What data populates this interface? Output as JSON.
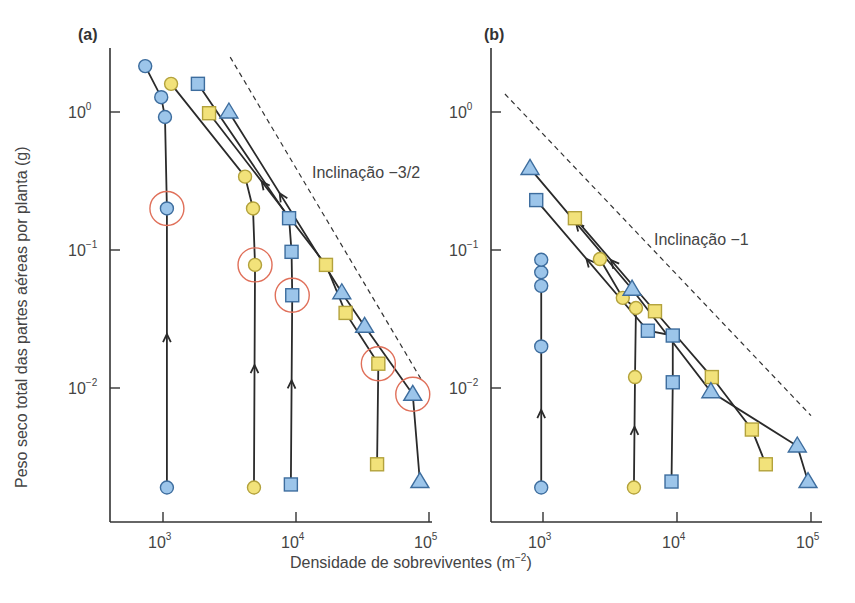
{
  "figure": {
    "ylabel": "Peso seco total das partes aéreas por planta (g)",
    "xlabel": "Densidade de sobreviventes (m",
    "xlabel_sup": "−2",
    "xlabel_close": ")",
    "colors": {
      "blue_fill": "#9cc5ea",
      "blue_stroke": "#3d6d9e",
      "yellow_fill": "#f2e27a",
      "yellow_stroke": "#b3a23c",
      "highlight_ring": "#e0705a",
      "line": "#2a2a2a"
    }
  },
  "chart_data": [
    {
      "panel": "(a)",
      "type": "scatter",
      "title": "(a)",
      "xlabel": "Densidade de sobreviventes (m^-2)",
      "ylabel": "Peso seco total das partes aéreas por planta (g)",
      "xscale": "log",
      "yscale": "log",
      "xlim": [
        400,
        110000
      ],
      "ylim": [
        0.0012,
        3.3
      ],
      "xticks": [
        "10^3",
        "10^4",
        "10^5"
      ],
      "yticks": [
        "10^0",
        "10^-1",
        "10^-2"
      ],
      "grid": false,
      "annotation": "Inclinação −3/2",
      "reference_line": {
        "style": "dashed",
        "slope": -1.5,
        "from": [
          3200,
          2.5
        ],
        "to": [
          90000,
          0.011
        ]
      },
      "series": [
        {
          "name": "blue circles",
          "marker": "circle",
          "color": "blue",
          "points": [
            [
              1070,
              0.0019
            ],
            [
              1070,
              0.2
            ],
            [
              1035,
              0.92
            ],
            [
              970,
              1.28
            ],
            [
              735,
              2.15
            ]
          ],
          "highlighted": [
            [
              1070,
              0.2
            ]
          ]
        },
        {
          "name": "yellow circles",
          "marker": "circle",
          "color": "yellow",
          "points": [
            [
              4830,
              0.0019
            ],
            [
              4920,
              0.078
            ],
            [
              4750,
              0.2
            ],
            [
              4140,
              0.34
            ],
            [
              1150,
              1.6
            ]
          ],
          "highlighted": [
            [
              4920,
              0.078
            ]
          ]
        },
        {
          "name": "blue squares",
          "marker": "square",
          "color": "blue",
          "points": [
            [
              9150,
              0.002
            ],
            [
              9370,
              0.047
            ],
            [
              9260,
              0.097
            ],
            [
              8870,
              0.17
            ],
            [
              1830,
              1.6
            ]
          ],
          "highlighted": [
            [
              9370,
              0.047
            ]
          ]
        },
        {
          "name": "yellow squares",
          "marker": "square",
          "color": "yellow",
          "points": [
            [
              40700,
              0.0028
            ],
            [
              41600,
              0.015
            ],
            [
              23600,
              0.035
            ],
            [
              16800,
              0.078
            ],
            [
              2220,
              0.98
            ]
          ],
          "highlighted": [
            [
              41600,
              0.015
            ]
          ]
        },
        {
          "name": "blue triangles",
          "marker": "triangle",
          "color": "blue",
          "points": [
            [
              85400,
              0.0021
            ],
            [
              75500,
              0.009
            ],
            [
              32800,
              0.028
            ],
            [
              22100,
              0.049
            ],
            [
              3130,
              1.0
            ]
          ],
          "highlighted": [
            [
              75500,
              0.009
            ]
          ]
        }
      ]
    },
    {
      "panel": "(b)",
      "type": "scatter",
      "title": "(b)",
      "xlabel": "Densidade de sobreviventes (m^-2)",
      "ylabel": "Peso seco total das partes aéreas por planta (g)",
      "xscale": "log",
      "yscale": "log",
      "xlim": [
        400,
        110000
      ],
      "ylim": [
        0.0012,
        3.3
      ],
      "xticks": [
        "10^3",
        "10^4",
        "10^5"
      ],
      "yticks": [
        "10^0",
        "10^-1",
        "10^-2"
      ],
      "grid": false,
      "annotation": "Inclinação −1",
      "reference_line": {
        "style": "dashed",
        "slope": -1,
        "from": [
          520,
          1.35
        ],
        "to": [
          100000,
          0.0063
        ]
      },
      "series": [
        {
          "name": "blue circles",
          "marker": "circle",
          "color": "blue",
          "points": [
            [
              970,
              0.0019
            ],
            [
              970,
              0.02
            ],
            [
              970,
              0.055
            ],
            [
              970,
              0.069
            ],
            [
              970,
              0.085
            ]
          ]
        },
        {
          "name": "yellow circles",
          "marker": "circle",
          "color": "yellow",
          "points": [
            [
              4770,
              0.0019
            ],
            [
              4860,
              0.012
            ],
            [
              4940,
              0.038
            ],
            [
              3940,
              0.045
            ],
            [
              2660,
              0.086
            ]
          ]
        },
        {
          "name": "blue squares",
          "marker": "square",
          "color": "blue",
          "points": [
            [
              9100,
              0.0021
            ],
            [
              9300,
              0.011
            ],
            [
              9300,
              0.024
            ],
            [
              6060,
              0.026
            ],
            [
              890,
              0.23
            ]
          ]
        },
        {
          "name": "yellow squares",
          "marker": "square",
          "color": "yellow",
          "points": [
            [
              46000,
              0.0028
            ],
            [
              36200,
              0.005
            ],
            [
              18200,
              0.012
            ],
            [
              6850,
              0.036
            ],
            [
              1730,
              0.17
            ]
          ]
        },
        {
          "name": "blue triangles",
          "marker": "triangle",
          "color": "blue",
          "points": [
            [
              95000,
              0.0021
            ],
            [
              79000,
              0.0038
            ],
            [
              17900,
              0.0094
            ],
            [
              4620,
              0.052
            ],
            [
              800,
              0.39
            ]
          ]
        }
      ]
    }
  ]
}
